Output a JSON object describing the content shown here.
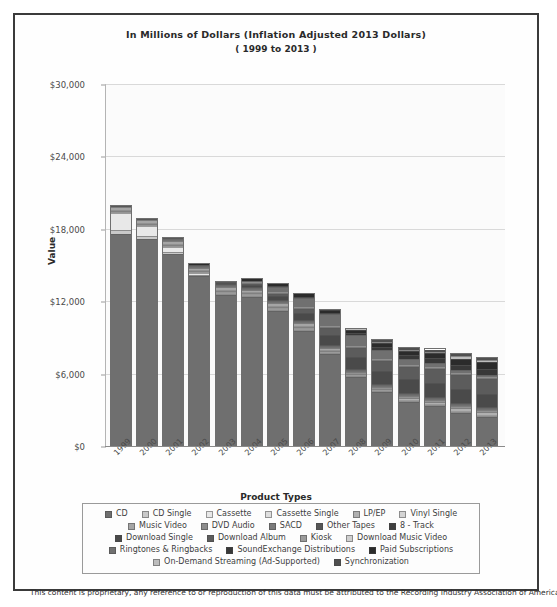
{
  "chart": {
    "title_line1": "In Millions of Dollars (Inflation Adjusted 2013 Dollars)",
    "title_line2": "( 1999 to 2013 )",
    "ylabel": "Value",
    "xlabel": "Product Types"
  },
  "footer": {
    "text": "This content is proprietary, any reference to or reproduction of this data must be attributed to the Recording Industry Association of America."
  },
  "chart_data": {
    "type": "bar",
    "stacked": true,
    "title": "In Millions of Dollars (Inflation Adjusted 2013 Dollars) ( 1999 to 2013 )",
    "xlabel": "Product Types",
    "ylabel": "Value",
    "ylim": [
      0,
      30000
    ],
    "yticks": [
      0,
      6000,
      12000,
      18000,
      24000,
      30000
    ],
    "ytick_labels": [
      "$0",
      "$6,000",
      "$12,000",
      "$18,000",
      "$24,000",
      "$30,000"
    ],
    "grid": true,
    "legend_position": "bottom",
    "categories": [
      "1999",
      "2000",
      "2001",
      "2002",
      "2003",
      "2004",
      "2005",
      "2006",
      "2007",
      "2008",
      "2009",
      "2010",
      "2011",
      "2012",
      "2013"
    ],
    "series": [
      {
        "name": "CD",
        "color": "#6f6f6f",
        "values": [
          17800,
          17500,
          16400,
          14600,
          13200,
          13100,
          12000,
          10300,
          8200,
          6200,
          4900,
          4100,
          3700,
          3100,
          2700
        ]
      },
      {
        "name": "CD Single",
        "color": "#c9c9c9",
        "values": [
          330,
          220,
          130,
          80,
          60,
          40,
          30,
          20,
          15,
          10,
          8,
          5,
          4,
          3,
          2
        ]
      },
      {
        "name": "Cassette",
        "color": "#e8e8e8",
        "values": [
          1400,
          800,
          500,
          160,
          60,
          30,
          10,
          5,
          3,
          2,
          1,
          1,
          1,
          1,
          1
        ]
      },
      {
        "name": "Cassette Single",
        "color": "#dedede",
        "values": [
          110,
          60,
          30,
          10,
          4,
          2,
          1,
          1,
          0,
          0,
          0,
          0,
          0,
          0,
          0
        ]
      },
      {
        "name": "LP/EP",
        "color": "#b0b0b0",
        "values": [
          50,
          40,
          40,
          30,
          30,
          30,
          30,
          40,
          50,
          70,
          90,
          120,
          160,
          230,
          310
        ]
      },
      {
        "name": "Vinyl Single",
        "color": "#d4d4d4",
        "values": [
          40,
          30,
          20,
          10,
          10,
          10,
          5,
          5,
          5,
          5,
          5,
          5,
          5,
          5,
          5
        ]
      },
      {
        "name": "Music Video",
        "color": "#a5a5a5",
        "values": [
          250,
          260,
          220,
          200,
          230,
          230,
          230,
          200,
          160,
          120,
          90,
          70,
          60,
          50,
          40
        ]
      },
      {
        "name": "DVD Audio",
        "color": "#8c8c8c",
        "values": [
          0,
          0,
          30,
          50,
          60,
          40,
          30,
          20,
          10,
          5,
          3,
          2,
          1,
          1,
          1
        ]
      },
      {
        "name": "SACD",
        "color": "#7a7a7a",
        "values": [
          0,
          0,
          10,
          30,
          40,
          40,
          30,
          20,
          10,
          5,
          3,
          2,
          1,
          1,
          1
        ]
      },
      {
        "name": "Other Tapes",
        "color": "#565656",
        "values": [
          60,
          40,
          30,
          20,
          10,
          8,
          5,
          3,
          2,
          1,
          1,
          1,
          1,
          1,
          1
        ]
      },
      {
        "name": "8 - Track",
        "color": "#3f3f3f",
        "values": [
          2,
          1,
          1,
          0,
          0,
          0,
          0,
          0,
          0,
          0,
          0,
          0,
          0,
          0,
          0
        ]
      },
      {
        "name": "Download Single",
        "color": "#4a4a4a",
        "values": [
          0,
          0,
          0,
          0,
          20,
          180,
          400,
          650,
          900,
          1100,
          1200,
          1300,
          1350,
          1300,
          1200
        ]
      },
      {
        "name": "Download Album",
        "color": "#5c5c5c",
        "values": [
          0,
          0,
          0,
          0,
          5,
          60,
          170,
          380,
          600,
          800,
          950,
          1100,
          1250,
          1350,
          1400
        ]
      },
      {
        "name": "Kiosk",
        "color": "#9b9b9b",
        "values": [
          0,
          0,
          0,
          0,
          0,
          2,
          5,
          8,
          10,
          10,
          9,
          8,
          7,
          6,
          5
        ]
      },
      {
        "name": "Download Music Video",
        "color": "#cfcfcf",
        "values": [
          0,
          0,
          0,
          0,
          0,
          3,
          10,
          20,
          30,
          30,
          25,
          20,
          15,
          12,
          10
        ]
      },
      {
        "name": "Ringtones & Ringbacks",
        "color": "#707070",
        "values": [
          0,
          0,
          0,
          0,
          0,
          100,
          450,
          800,
          1100,
          1000,
          800,
          550,
          380,
          250,
          180
        ]
      },
      {
        "name": "SoundExchange Distributions",
        "color": "#383838",
        "values": [
          0,
          0,
          0,
          0,
          0,
          0,
          20,
          50,
          100,
          180,
          300,
          380,
          450,
          500,
          590
        ]
      },
      {
        "name": "Paid Subscriptions",
        "color": "#2b2b2b",
        "values": [
          0,
          0,
          0,
          20,
          60,
          120,
          180,
          220,
          250,
          280,
          330,
          380,
          450,
          570,
          630
        ]
      },
      {
        "name": "On-Demand Streaming (Ad-Supported)",
        "color": "#bdbdbd",
        "values": [
          0,
          0,
          0,
          0,
          0,
          0,
          0,
          0,
          10,
          30,
          60,
          100,
          140,
          190,
          220
        ]
      },
      {
        "name": "Synchronization",
        "color": "#4f4f4f",
        "values": [
          0,
          0,
          0,
          0,
          0,
          0,
          0,
          0,
          0,
          0,
          160,
          180,
          190,
          190,
          190
        ]
      }
    ]
  },
  "legend_rows": [
    [
      "CD",
      "CD Single",
      "Cassette",
      "Cassette Single",
      "LP/EP",
      "Vinyl Single"
    ],
    [
      "Music Video",
      "DVD Audio",
      "SACD",
      "Other Tapes",
      "8 - Track"
    ],
    [
      "Download Single",
      "Download Album",
      "Kiosk",
      "Download Music Video"
    ],
    [
      "Ringtones & Ringbacks",
      "SoundExchange Distributions",
      "Paid Subscriptions"
    ],
    [
      "On-Demand Streaming (Ad-Supported)",
      "Synchronization"
    ]
  ]
}
